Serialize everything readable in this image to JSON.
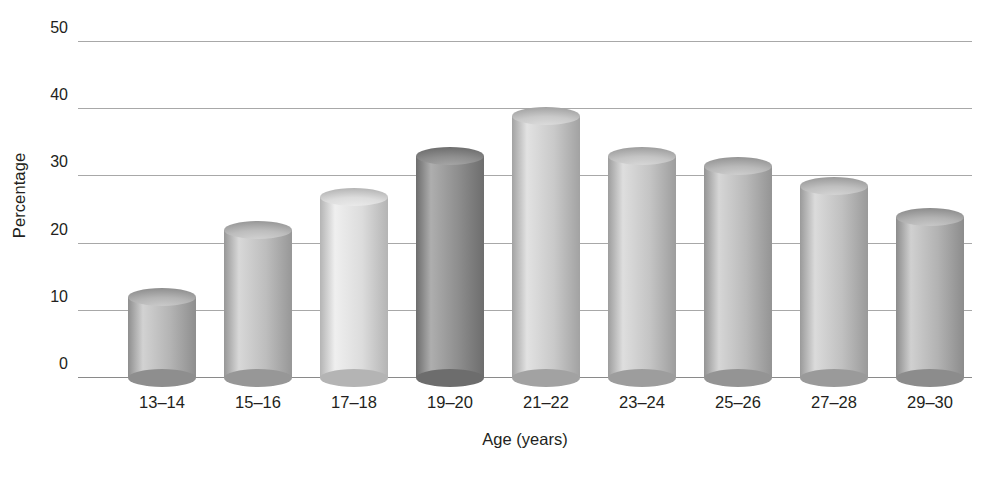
{
  "chart_data": {
    "type": "bar",
    "title": "",
    "subtitle": "",
    "xlabel": "Age (years)",
    "ylabel": "Percentage",
    "categories": [
      "13–14",
      "15–16",
      "17–18",
      "19–20",
      "21–22",
      "23–24",
      "25–26",
      "27–28",
      "29–30"
    ],
    "values": [
      12,
      22,
      27,
      33,
      39,
      33,
      31.5,
      28.5,
      24
    ],
    "series": [
      {
        "name": "Percentage",
        "values": [
          12,
          22,
          27,
          33,
          39,
          33,
          31.5,
          28.5,
          24
        ]
      }
    ],
    "ylim": [
      0,
      50
    ],
    "xlim": null,
    "ytick_labels": [
      "0",
      "10",
      "20",
      "30",
      "40",
      "50"
    ],
    "ytick_values": [
      0,
      10,
      20,
      30,
      40,
      50
    ],
    "grid": true,
    "grid_axis": "y",
    "legend": false,
    "legend_position": "none",
    "annotations": [],
    "bar_style": "3d-cylinder",
    "bar_colors": [
      "#b4b4b4",
      "#bdbdbd",
      "#dcdcdc",
      "#8e8e8e",
      "#c9c9c9",
      "#c4c4c4",
      "#b9b9b9",
      "#c0c0c0",
      "#b2b2b2"
    ],
    "bar_colors_dark": [
      "#8e8e8e",
      "#979797",
      "#b4b4b4",
      "#6d6d6d",
      "#a2a2a2",
      "#9d9d9d",
      "#949494",
      "#9a9a9a",
      "#8c8c8c"
    ],
    "bar_colors_light": [
      "#d2d2d2",
      "#d8d8d8",
      "#efefef",
      "#aeaeae",
      "#e2e2e2",
      "#dedede",
      "#d6d6d6",
      "#dbdbdb",
      "#d0d0d0"
    ],
    "gridline_color": "#a8a8a8",
    "text_color": "#231f20",
    "background_color": "#ffffff"
  }
}
